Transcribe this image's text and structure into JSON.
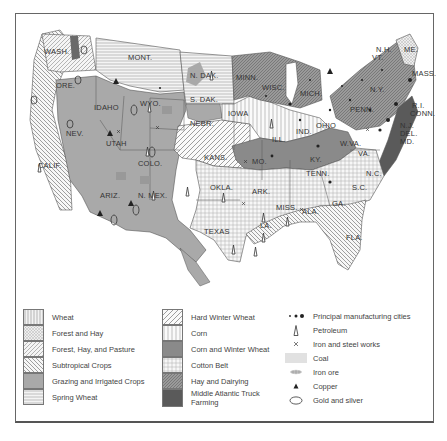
{
  "map": {
    "title": "",
    "states": {
      "wash": "WASH.",
      "ore": "ORE.",
      "calif": "CALIF.",
      "idaho": "IDAHO",
      "nev": "NEV.",
      "mont": "MONT.",
      "wyo": "WYO.",
      "utah": "UTAH",
      "colo": "COLO.",
      "ariz": "ARIZ.",
      "n_mex": "N. MEX.",
      "n_dak": "N. DAK.",
      "s_dak": "S. DAK.",
      "nebr": "NEBR.",
      "kans": "KANS.",
      "okla": "OKLA.",
      "texas": "TEXAS",
      "minn": "MINN.",
      "iowa": "IOWA",
      "mo": "MO.",
      "ark": "ARK.",
      "la": "LA.",
      "wisc": "WISC.",
      "ill": "ILL.",
      "mich": "MICH.",
      "ind": "IND.",
      "ohio": "OHIO",
      "ky": "KY.",
      "tenn": "TENN.",
      "miss": "MISS.",
      "ala": "ALA.",
      "ga": "GA.",
      "fla": "FLA.",
      "s_c": "S.C.",
      "n_c": "N.C.",
      "va": "VA.",
      "w_va": "W.VA.",
      "penn": "PENN.",
      "n_y": "N.Y.",
      "me": "ME.",
      "n_h": "N.H.",
      "vt": "VT.",
      "mass": "MASS.",
      "r_i": "R.I.",
      "conn": "CONN.",
      "n_j": "N.J.",
      "del": "DEL.",
      "md": "MD."
    }
  },
  "legend": {
    "regions_col1": [
      {
        "label": "Wheat",
        "pattern": "vertical-lines"
      },
      {
        "label": "Forest and Hay",
        "pattern": "crosshatch-fine"
      },
      {
        "label": "Forest, Hay, and Pasture",
        "pattern": "diagonal-fine"
      },
      {
        "label": "Subtropical Crops",
        "pattern": "diagonal-back"
      },
      {
        "label": "Grazing and Irrigated Crops",
        "pattern": "solid-gray"
      },
      {
        "label": "Spring Wheat",
        "pattern": "horizontal-lines"
      }
    ],
    "regions_col2": [
      {
        "label": "Hard Winter Wheat",
        "pattern": "diagonal-wide"
      },
      {
        "label": "Corn",
        "pattern": "vertical-wide"
      },
      {
        "label": "Corn and Winter Wheat",
        "pattern": "solid-dark-gray"
      },
      {
        "label": "Cotton Belt",
        "pattern": "grid"
      },
      {
        "label": "Hay and Dairying",
        "pattern": "diagonal-dark"
      },
      {
        "label": "Middle Atlantic Truck",
        "label2": "Farming",
        "pattern": "solid-darkest"
      }
    ],
    "symbols": [
      {
        "label": "Principal manufacturing cities",
        "icon": "dots-icon"
      },
      {
        "label": "Petroleum",
        "icon": "oil-derrick-icon"
      },
      {
        "label": "Iron and steel works",
        "icon": "cross-x-icon"
      },
      {
        "label": "Coal",
        "icon": "coal-lines-icon"
      },
      {
        "label": "Iron ore",
        "icon": "iron-ore-icon"
      },
      {
        "label": "Copper",
        "icon": "triangle-icon"
      },
      {
        "label": "Gold and silver",
        "icon": "ellipse-icon"
      }
    ]
  },
  "colors": {
    "grazing": "#a9a9a9",
    "corn_winter_wheat": "#8a8a8a",
    "truck_farming": "#5a5a5a",
    "hay_dairy": "#9a9a9a",
    "line": "#555555",
    "background": "#ffffff"
  }
}
